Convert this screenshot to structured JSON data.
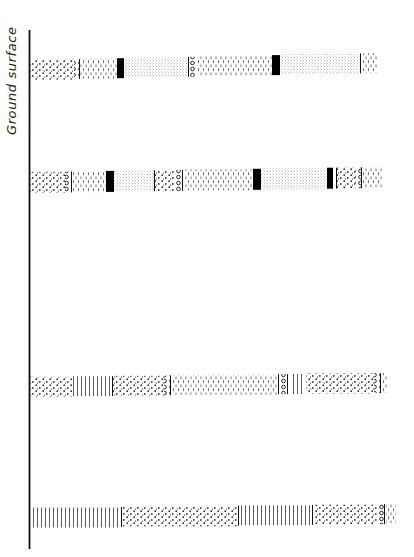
{
  "axis": {
    "label": "Ground surface",
    "line": {
      "x": 29.5,
      "y1": 30,
      "y2": 549
    }
  },
  "colors": {
    "ink": "#111111",
    "fill": "#000000",
    "background": "#ffffff"
  },
  "legend_patterns": {
    "coarse_dots": "coarse stippled dots",
    "fine_dots": "fine stippled dots",
    "dashes": "short vertical dashes",
    "vlines": "vertical lines",
    "circles": "column of small circles",
    "black": "solid black band",
    "line": "thin vertical divider"
  },
  "bands": [
    {
      "name": "layer-1",
      "y_top_left": 60,
      "y_top_right": 53,
      "height": 20,
      "segments": [
        {
          "type": "coarse_dots",
          "x1": 30,
          "x2": 74
        },
        {
          "type": "circles",
          "x1": 74,
          "x2": 79
        },
        {
          "type": "line",
          "x1": 79,
          "x2": 80
        },
        {
          "type": "dashes",
          "x1": 80,
          "x2": 117
        },
        {
          "type": "black",
          "x1": 117,
          "x2": 124
        },
        {
          "type": "fine_dots",
          "x1": 124,
          "x2": 188
        },
        {
          "type": "line",
          "x1": 188,
          "x2": 189
        },
        {
          "type": "circles",
          "x1": 190,
          "x2": 197
        },
        {
          "type": "dashes",
          "x1": 197,
          "x2": 272
        },
        {
          "type": "black",
          "x1": 272,
          "x2": 280
        },
        {
          "type": "fine_dots",
          "x1": 280,
          "x2": 360
        },
        {
          "type": "line",
          "x1": 360,
          "x2": 361
        },
        {
          "type": "dashes",
          "x1": 362,
          "x2": 378
        }
      ]
    },
    {
      "name": "layer-2",
      "y_top_left": 172,
      "y_top_right": 167,
      "height": 21,
      "segments": [
        {
          "type": "coarse_dots",
          "x1": 30,
          "x2": 65
        },
        {
          "type": "circles",
          "x1": 65,
          "x2": 71
        },
        {
          "type": "line",
          "x1": 71,
          "x2": 72
        },
        {
          "type": "dashes",
          "x1": 72,
          "x2": 106
        },
        {
          "type": "black",
          "x1": 106,
          "x2": 114
        },
        {
          "type": "fine_dots",
          "x1": 114,
          "x2": 154
        },
        {
          "type": "line",
          "x1": 154,
          "x2": 155
        },
        {
          "type": "coarse_dots",
          "x1": 155,
          "x2": 175
        },
        {
          "type": "circles",
          "x1": 175,
          "x2": 182
        },
        {
          "type": "line",
          "x1": 182,
          "x2": 183
        },
        {
          "type": "dashes",
          "x1": 184,
          "x2": 253
        },
        {
          "type": "black",
          "x1": 253,
          "x2": 261
        },
        {
          "type": "fine_dots",
          "x1": 261,
          "x2": 327
        },
        {
          "type": "black",
          "x1": 327,
          "x2": 333
        },
        {
          "type": "line",
          "x1": 336,
          "x2": 337
        },
        {
          "type": "coarse_dots",
          "x1": 337,
          "x2": 355
        },
        {
          "type": "circles",
          "x1": 355,
          "x2": 361
        },
        {
          "type": "line",
          "x1": 361,
          "x2": 362
        },
        {
          "type": "dashes",
          "x1": 363,
          "x2": 382
        }
      ]
    },
    {
      "name": "layer-3",
      "y_top_left": 377,
      "y_top_right": 373,
      "height": 20,
      "segments": [
        {
          "type": "coarse_dots",
          "x1": 30,
          "x2": 72
        },
        {
          "type": "vlines",
          "x1": 73,
          "x2": 111
        },
        {
          "type": "line",
          "x1": 112,
          "x2": 113
        },
        {
          "type": "coarse_dots",
          "x1": 113,
          "x2": 164
        },
        {
          "type": "circles",
          "x1": 164,
          "x2": 170
        },
        {
          "type": "line",
          "x1": 170,
          "x2": 171
        },
        {
          "type": "dashes",
          "x1": 172,
          "x2": 277
        },
        {
          "type": "line",
          "x1": 278,
          "x2": 279
        },
        {
          "type": "circles",
          "x1": 279,
          "x2": 286
        },
        {
          "type": "line",
          "x1": 287,
          "x2": 288
        },
        {
          "type": "vlines",
          "x1": 290,
          "x2": 305
        },
        {
          "type": "coarse_dots",
          "x1": 306,
          "x2": 374
        },
        {
          "type": "circles",
          "x1": 374,
          "x2": 380
        },
        {
          "type": "line",
          "x1": 380,
          "x2": 381
        },
        {
          "type": "dashes",
          "x1": 382,
          "x2": 388
        }
      ]
    },
    {
      "name": "layer-4",
      "y_top_left": 508,
      "y_top_right": 504,
      "height": 20,
      "segments": [
        {
          "type": "vlines",
          "x1": 33,
          "x2": 121
        },
        {
          "type": "line",
          "x1": 121,
          "x2": 122
        },
        {
          "type": "coarse_dots",
          "x1": 123,
          "x2": 237
        },
        {
          "type": "line",
          "x1": 238,
          "x2": 239
        },
        {
          "type": "vlines",
          "x1": 240,
          "x2": 311
        },
        {
          "type": "line",
          "x1": 312,
          "x2": 313
        },
        {
          "type": "coarse_dots",
          "x1": 314,
          "x2": 378
        },
        {
          "type": "circles",
          "x1": 378,
          "x2": 384
        },
        {
          "type": "line",
          "x1": 384,
          "x2": 385
        },
        {
          "type": "dashes",
          "x1": 386,
          "x2": 396
        }
      ]
    }
  ]
}
